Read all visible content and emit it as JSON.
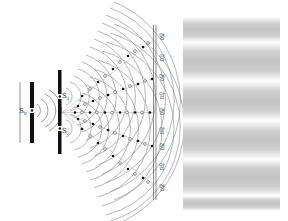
{
  "diagram": {
    "source_label": "S0",
    "source_label_text": "S",
    "source_label_sub": "0",
    "slit1_label_text": "S",
    "slit1_label_sub": "1",
    "slit2_label_text": "S",
    "slit2_label_sub": "2",
    "screen_labels": [
      "명",
      "암",
      "명",
      "암",
      "명",
      "암",
      "명",
      "암",
      "명"
    ],
    "screen_label_meanings": {
      "명": "bright",
      "암": "dark"
    },
    "fringe_pattern": {
      "bands": 6,
      "band_color": "#c8c8c8",
      "gap_color": "#ffffff"
    },
    "colors": {
      "line": "#555555",
      "barrier": "#111111",
      "crest_marker": "#111111",
      "trough_marker": "#ffffff"
    }
  }
}
